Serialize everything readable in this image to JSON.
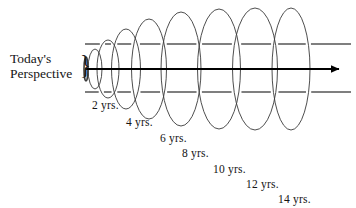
{
  "figure": {
    "title_label": "Today's Perspective",
    "perspective_line_1": "Today's",
    "perspective_line_2": "Perspective",
    "brace_glyph": "}",
    "background_color": "#ffffff",
    "ink_color": "#1a1a1a",
    "axis_arrow_color": "#000000",
    "ellipse_stroke_color": "#3a3a3a",
    "guide_line_color": "#555555"
  },
  "chart_data": {
    "type": "diagram",
    "title": "Today's Perspective",
    "xlabel": "",
    "ylabel": "",
    "axis": {
      "x_start": 85,
      "x_end": 341,
      "y": 69,
      "arrow_head": "right"
    },
    "guide_lines": {
      "top_y": 44,
      "bottom_y": 92,
      "x_start": 85,
      "x_end": 351,
      "style": "dashed-by-occlusion"
    },
    "categories": [
      "2 yrs.",
      "4 yrs.",
      "6 yrs.",
      "8 yrs.",
      "10 yrs.",
      "12 yrs.",
      "14 yrs."
    ],
    "values": [
      2,
      4,
      6,
      8,
      10,
      12,
      14
    ],
    "units": "years",
    "ellipses": [
      {
        "label": "origin",
        "cx": 86,
        "cy": 69,
        "rx": 2,
        "ry": 12
      },
      {
        "label": "2 yrs.",
        "cx": 95,
        "cy": 69,
        "rx": 7,
        "ry": 20
      },
      {
        "label": "4 yrs.",
        "cx": 108,
        "cy": 69,
        "rx": 11,
        "ry": 29
      },
      {
        "label": "6 yrs.",
        "cx": 126,
        "cy": 69,
        "rx": 14.5,
        "ry": 40
      },
      {
        "label": "8 yrs.",
        "cx": 149,
        "cy": 69,
        "rx": 17.5,
        "ry": 50
      },
      {
        "label": "10 yrs.",
        "cx": 181,
        "cy": 69,
        "rx": 20,
        "ry": 57
      },
      {
        "label": "12 yrs.",
        "cx": 219,
        "cy": 69,
        "rx": 21.5,
        "ry": 60
      },
      {
        "label": "14 yrs.",
        "cx": 255,
        "cy": 69,
        "rx": 22.5,
        "ry": 61
      },
      {
        "label": "outer",
        "cx": 291,
        "cy": 69,
        "rx": 19,
        "ry": 61
      }
    ],
    "year_labels": [
      {
        "text": "2 yrs.",
        "x": 92,
        "y": 110
      },
      {
        "text": "4 yrs.",
        "x": 126,
        "y": 127
      },
      {
        "text": "6 yrs.",
        "x": 160,
        "y": 143
      },
      {
        "text": "8 yrs.",
        "x": 182,
        "y": 158
      },
      {
        "text": "10 yrs.",
        "x": 213,
        "y": 174
      },
      {
        "text": "12 yrs.",
        "x": 246,
        "y": 189
      },
      {
        "text": "14 yrs.",
        "x": 278,
        "y": 204
      }
    ],
    "legend": [],
    "grid": false
  }
}
